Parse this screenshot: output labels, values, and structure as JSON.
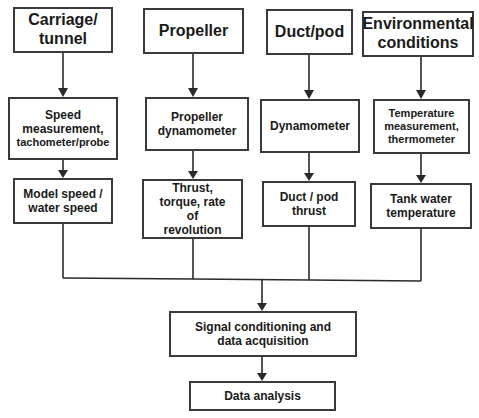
{
  "diagram": {
    "sources": [
      {
        "label": "Carriage/\ntunnel"
      },
      {
        "label": "Propeller"
      },
      {
        "label": "Duct/pod"
      },
      {
        "label": "Environmental conditions"
      }
    ],
    "instruments": [
      {
        "label": "Speed measurement,",
        "sub": "tachometer/probe"
      },
      {
        "label": "Propeller dynamometer"
      },
      {
        "label": "Dynamometer"
      },
      {
        "label": "Temperature measurement,",
        "sub": "thermometer"
      }
    ],
    "measurements": [
      {
        "label": "Model speed / water speed"
      },
      {
        "label": "Thrust, torque, rate of revolution"
      },
      {
        "label": "Duct / pod thrust"
      },
      {
        "label": "Tank water temperature"
      }
    ],
    "signal_conditioning": "Signal conditioning and data acquisition",
    "data_analysis": "Data analysis"
  }
}
